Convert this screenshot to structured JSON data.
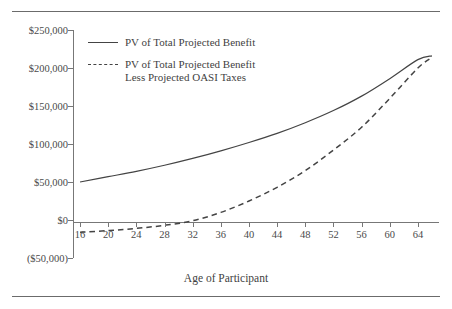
{
  "figure": {
    "clipped_header": "",
    "axis_title": "Age of Participant"
  },
  "legend": {
    "items": [
      {
        "style": "solid",
        "lines": [
          "PV of Total Projected Benefit"
        ]
      },
      {
        "style": "dashed",
        "lines": [
          "PV of Total Projected Benefit",
          "Less Projected OASI Taxes"
        ]
      }
    ]
  },
  "chart_data": {
    "type": "line",
    "title": "",
    "xlabel": "Age of Participant",
    "ylabel": "",
    "grid": false,
    "legend_position": "upper-left-inside",
    "x": [
      16,
      20,
      24,
      28,
      32,
      36,
      40,
      44,
      48,
      52,
      56,
      60,
      64,
      66
    ],
    "xlim": [
      15,
      67
    ],
    "ylim": [
      -50000,
      250000
    ],
    "xticks": [
      16,
      20,
      24,
      28,
      32,
      36,
      40,
      44,
      48,
      52,
      56,
      60,
      64
    ],
    "xtick_labels": [
      "16",
      "20",
      "24",
      "28",
      "32",
      "36",
      "40",
      "44",
      "48",
      "52",
      "56",
      "60",
      "64"
    ],
    "yticks": [
      -50000,
      0,
      50000,
      100000,
      150000,
      200000,
      250000
    ],
    "ytick_labels": [
      "($50,000)",
      "$0",
      "$50,000",
      "$100,000",
      "$150,000",
      "$200,000",
      "$250,000"
    ],
    "series": [
      {
        "name": "PV of Total Projected Benefit",
        "style": "solid",
        "color": "#444444",
        "values": [
          50000,
          57000,
          64000,
          72000,
          81000,
          91000,
          102000,
          114000,
          128000,
          144000,
          163000,
          186000,
          211000,
          216000
        ]
      },
      {
        "name": "PV of Total Projected Benefit Less Projected OASI Taxes",
        "style": "dashed",
        "color": "#444444",
        "values": [
          -16000,
          -14000,
          -11000,
          -7000,
          -1000,
          10000,
          25000,
          43000,
          65000,
          92000,
          122000,
          160000,
          200000,
          214000
        ]
      }
    ]
  },
  "colors": {
    "line": "#444444",
    "axis": "#777777",
    "text": "#3f3f3f",
    "rule": "#6b6b6b",
    "background": "#ffffff"
  }
}
